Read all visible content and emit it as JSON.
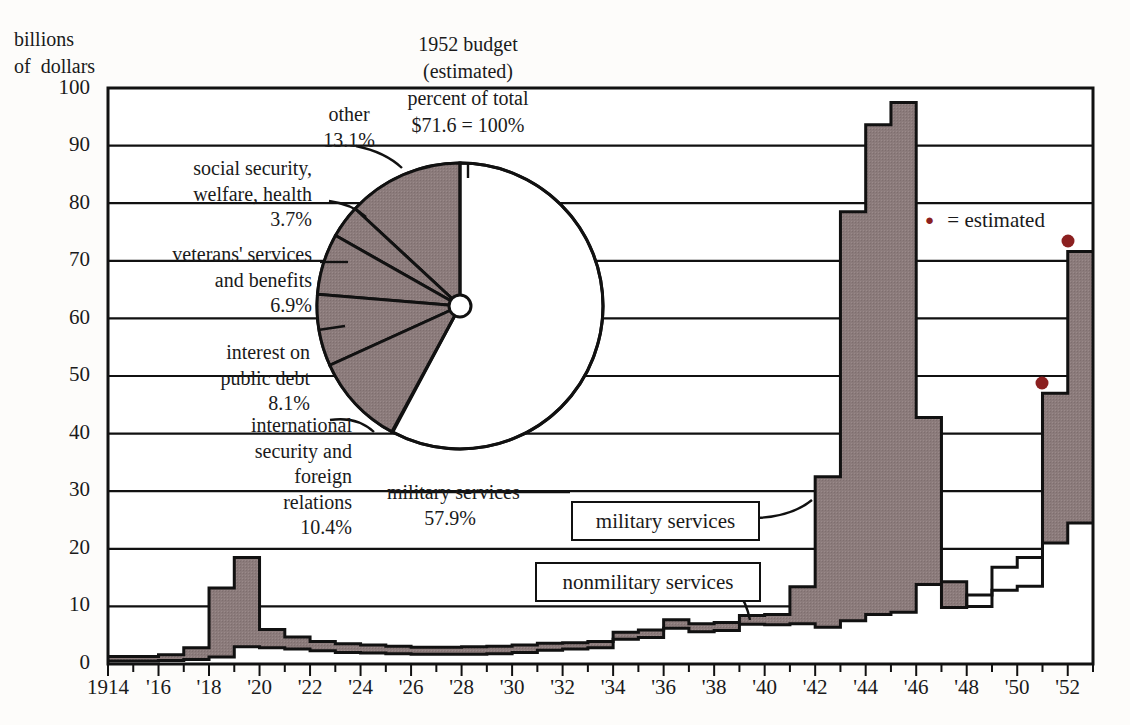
{
  "axis": {
    "y_title": "billions\nof  dollars",
    "y_ticks": [
      "100",
      "90",
      "80",
      "70",
      "60",
      "50",
      "40",
      "30",
      "20",
      "10",
      "0"
    ],
    "x_ticks": [
      "1914",
      "'16",
      "'18",
      "'20",
      "'22",
      "'24",
      "'26",
      "'28",
      "'30",
      "'32",
      "'34",
      "'36",
      "'38",
      "'40",
      "'42",
      "'44",
      "'46",
      "'48",
      "'50",
      "'52"
    ]
  },
  "pie_title": "1952 budget\n(estimated)\npercent of total\n$71.6 = 100%",
  "pie_labels": {
    "other": {
      "name": "other",
      "pct": "13.1%"
    },
    "social": {
      "name": "social security,\nwelfare, health",
      "pct": "3.7%"
    },
    "veterans": {
      "name": "veterans' services\nand benefits",
      "pct": "6.9%"
    },
    "interest": {
      "name": "interest on\npublic debt",
      "pct": "8.1%"
    },
    "international": {
      "name": "international\nsecurity and\nforeign\nrelations",
      "pct": "10.4%"
    },
    "military": {
      "name": "military services",
      "pct": "57.9%"
    }
  },
  "callouts": {
    "military": "military services",
    "nonmilitary": "nonmilitary services"
  },
  "legend": {
    "symbol": "●",
    "text": "= estimated"
  },
  "colors": {
    "shade": "#8b7b7b",
    "line": "#111111",
    "estimated_dot": "#8b2020",
    "background": "#fdfcfa"
  },
  "chart_data": {
    "type": "area",
    "xlabel": "",
    "ylabel": "billions of dollars",
    "ylim": [
      0,
      100
    ],
    "xlim": [
      1914,
      1953
    ],
    "grid": true,
    "legend_position": "inline-callout",
    "years": [
      1914,
      1915,
      1916,
      1917,
      1918,
      1919,
      1920,
      1921,
      1922,
      1923,
      1924,
      1925,
      1926,
      1927,
      1928,
      1929,
      1930,
      1931,
      1932,
      1933,
      1934,
      1935,
      1936,
      1937,
      1938,
      1939,
      1940,
      1941,
      1942,
      1943,
      1944,
      1945,
      1946,
      1947,
      1948,
      1949,
      1950,
      1951,
      1952
    ],
    "series": [
      {
        "name": "nonmilitary services",
        "values": [
          0.5,
          0.5,
          0.6,
          0.8,
          1.2,
          3.0,
          2.8,
          2.6,
          2.3,
          2.0,
          1.9,
          1.8,
          1.7,
          1.7,
          1.7,
          1.8,
          2.0,
          2.4,
          2.6,
          2.8,
          4.3,
          4.6,
          6.2,
          5.6,
          5.8,
          6.9,
          6.8,
          7.0,
          6.4,
          7.5,
          8.6,
          9.0,
          13.8,
          9.8,
          12.0,
          16.8,
          18.5,
          21.0,
          24.5
        ],
        "color": "#ffffff"
      },
      {
        "name": "military services",
        "values": [
          0.8,
          0.8,
          1.0,
          2.0,
          12.0,
          15.5,
          3.2,
          2.1,
          1.6,
          1.5,
          1.4,
          1.3,
          1.2,
          1.2,
          1.3,
          1.3,
          1.3,
          1.2,
          1.1,
          1.1,
          1.2,
          1.3,
          1.5,
          1.4,
          1.4,
          1.5,
          1.8,
          6.4,
          26.1,
          71.0,
          85.0,
          88.5,
          29.0,
          4.5,
          -2.0,
          -4.0,
          -5.0,
          26.0,
          47.1
        ],
        "color": "#8b7b7b"
      }
    ],
    "totals": [
      1.3,
      1.3,
      1.6,
      2.8,
      13.2,
      18.5,
      6.0,
      4.7,
      3.9,
      3.5,
      3.3,
      3.1,
      2.9,
      2.9,
      3.0,
      3.1,
      3.3,
      3.6,
      3.7,
      3.9,
      5.5,
      5.9,
      7.7,
      7.0,
      7.2,
      8.4,
      8.6,
      13.4,
      32.5,
      78.5,
      93.6,
      97.5,
      42.8,
      14.3,
      10.0,
      12.8,
      13.5,
      47.0,
      71.6
    ],
    "estimated_points": [
      {
        "year": 1951,
        "value": 47.0
      },
      {
        "year": 1952,
        "value": 71.6
      }
    ],
    "pie": {
      "type": "pie",
      "title": "1952 budget (estimated) percent of total $71.6 = 100%",
      "total_label": "$71.6 = 100%",
      "labels": [
        "military services",
        "other",
        "social security, welfare, health",
        "veterans' services and benefits",
        "interest on public debt",
        "international security and foreign relations"
      ],
      "values": [
        57.9,
        13.1,
        3.7,
        6.9,
        8.1,
        10.4
      ]
    }
  }
}
